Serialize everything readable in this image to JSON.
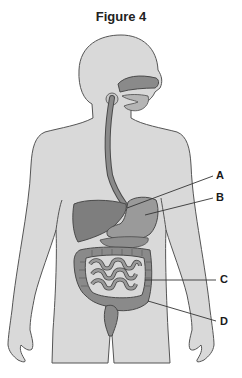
{
  "figure": {
    "title": "Figure 4",
    "labels": [
      {
        "id": "A",
        "text": "A",
        "points_to": "stomach upper region"
      },
      {
        "id": "B",
        "text": "B",
        "points_to": "stomach"
      },
      {
        "id": "C",
        "text": "C",
        "points_to": "small intestine"
      },
      {
        "id": "D",
        "text": "D",
        "points_to": "large intestine"
      }
    ]
  },
  "colors": {
    "body_fill": "#d9d9d9",
    "body_stroke": "#555555",
    "organ_fill": "#8a8a8a",
    "organ_stroke": "#4a4a4a",
    "organ_light": "#a3a3a3",
    "leader_line": "#333333"
  }
}
